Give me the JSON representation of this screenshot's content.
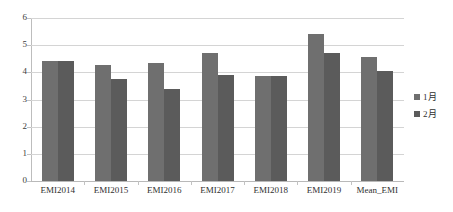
{
  "chart_data": {
    "type": "bar",
    "title": "",
    "subtitle": "",
    "xlabel": "",
    "ylabel": "",
    "ylim": [
      0,
      6
    ],
    "yticks": [
      0,
      1,
      2,
      3,
      4,
      5,
      6
    ],
    "ytick_labels": [
      "0",
      "1",
      "2",
      "3",
      "4",
      "5",
      "6"
    ],
    "grid": true,
    "legend_position": "right",
    "categories": [
      "EMI2014",
      "EMI2015",
      "EMI2016",
      "EMI2017",
      "EMI2018",
      "EMI2019",
      "Mean_EMI"
    ],
    "series": [
      {
        "name": "1月",
        "color": "#6f6f6f",
        "values": [
          4.42,
          4.27,
          4.33,
          4.7,
          3.88,
          5.43,
          4.58
        ]
      },
      {
        "name": "2月",
        "color": "#5b5b5b",
        "values": [
          4.42,
          3.77,
          3.38,
          3.9,
          3.86,
          4.7,
          4.05
        ]
      }
    ]
  },
  "legend": {
    "items": [
      {
        "label": "1月",
        "color": "#6f6f6f"
      },
      {
        "label": "2月",
        "color": "#5b5b5b"
      }
    ]
  },
  "colors": {
    "series_1": "#6f6f6f",
    "series_2": "#5b5b5b",
    "gridline": "#d4d4d4",
    "axis": "#bdbdbd",
    "text": "#2f2f2f",
    "background": "#ffffff"
  }
}
